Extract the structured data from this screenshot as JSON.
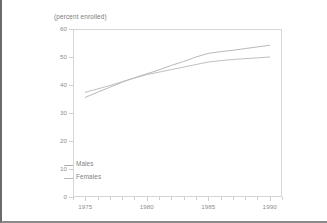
{
  "chart_data": {
    "type": "line",
    "title": "(percent enrolled)",
    "xlabel": "",
    "ylabel": "",
    "xlim": [
      1974,
      1991
    ],
    "ylim": [
      0,
      60
    ],
    "grid": false,
    "legend_position": "inside-bottom-left",
    "x_ticks": [
      1975,
      1980,
      1985,
      1990
    ],
    "x_minor_ticks": [
      1974,
      1976,
      1977,
      1978,
      1979,
      1981,
      1982,
      1983,
      1984,
      1986,
      1987,
      1988,
      1989,
      1991
    ],
    "y_ticks": [
      0,
      10,
      20,
      30,
      40,
      50,
      60
    ],
    "x": [
      1975,
      1976,
      1977,
      1978,
      1979,
      1980,
      1981,
      1982,
      1983,
      1984,
      1985,
      1986,
      1987,
      1988,
      1989,
      1990
    ],
    "series": [
      {
        "name": "Males",
        "color": "#b0b0b0",
        "values": [
          35.6,
          37.4,
          39.2,
          41.0,
          42.6,
          44.0,
          45.4,
          47.0,
          48.4,
          50.0,
          51.3,
          51.9,
          52.4,
          53.0,
          53.6,
          54.2
        ]
      },
      {
        "name": "Females",
        "color": "#b8b8b8",
        "values": [
          37.4,
          38.6,
          39.8,
          41.2,
          42.5,
          43.7,
          44.6,
          45.5,
          46.4,
          47.3,
          48.2,
          48.7,
          49.1,
          49.4,
          49.7,
          50.0
        ]
      }
    ]
  },
  "legend": {
    "items": [
      {
        "label": "Males"
      },
      {
        "label": "Females"
      }
    ]
  },
  "axis": {
    "y_labels": [
      "60",
      "50",
      "40",
      "30",
      "20",
      "10",
      "0"
    ],
    "x_labels": [
      "1975",
      "1980",
      "1985",
      "1990"
    ]
  },
  "colors": {
    "frame": "#d6d6d6",
    "text": "#8d8d8d",
    "line_males": "#b0b0b0",
    "line_females": "#b8b8b8",
    "page_border": "#6b6b6b",
    "background": "#ffffff"
  }
}
